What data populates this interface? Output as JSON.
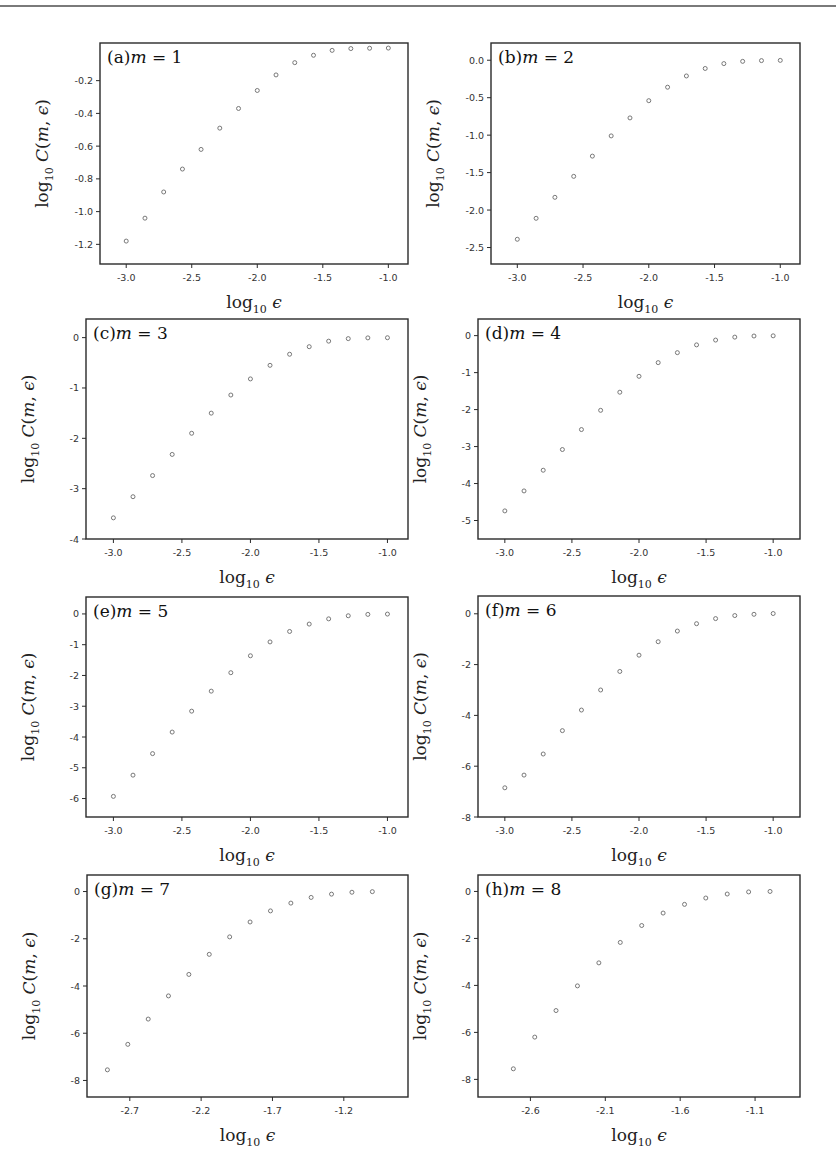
{
  "chart_data": [
    {
      "type": "scatter",
      "panel": "a",
      "title": "(a)m = 1",
      "label_prefix": "(a)",
      "m_value": "1",
      "xlabel": "log10 ε",
      "ylabel": "log10 C(m, ε)",
      "xlim": [
        -3.2,
        -0.85
      ],
      "ylim": [
        -1.32,
        0.03
      ],
      "xticks": [
        -3.0,
        -2.5,
        -2.0,
        -1.5,
        -1.0
      ],
      "xtick_labels": [
        "-3.0",
        "-2.5",
        "-2.0",
        "-1.5",
        "-1.0"
      ],
      "yticks": [
        -1.2,
        -1.0,
        -0.8,
        -0.6,
        -0.4,
        -0.2
      ],
      "ytick_labels": [
        "-1.2",
        "-1.0",
        "-0.8",
        "-0.6",
        "-0.4",
        "-0.2"
      ],
      "x": [
        -3.0,
        -2.857,
        -2.714,
        -2.571,
        -2.429,
        -2.286,
        -2.143,
        -2.0,
        -1.857,
        -1.714,
        -1.571,
        -1.429,
        -1.286,
        -1.143,
        -1.0
      ],
      "y": [
        -1.18,
        -1.04,
        -0.88,
        -0.74,
        -0.62,
        -0.49,
        -0.37,
        -0.26,
        -0.165,
        -0.09,
        -0.045,
        -0.015,
        -0.004,
        -0.002,
        -0.001
      ]
    },
    {
      "type": "scatter",
      "panel": "b",
      "title": "(b)m = 2",
      "label_prefix": "(b)",
      "m_value": "2",
      "xlabel": "log10 ε",
      "ylabel": "log10 C(m, ε)",
      "xlim": [
        -3.2,
        -0.85
      ],
      "ylim": [
        -2.72,
        0.23
      ],
      "xticks": [
        -3.0,
        -2.5,
        -2.0,
        -1.5,
        -1.0
      ],
      "xtick_labels": [
        "-3.0",
        "-2.5",
        "-2.0",
        "-1.5",
        "-1.0"
      ],
      "yticks": [
        -2.5,
        -2.0,
        -1.5,
        -1.0,
        -0.5,
        0.0
      ],
      "ytick_labels": [
        "-2.5",
        "-2.0",
        "-1.5",
        "-1.0",
        "-0.5",
        "0.0"
      ],
      "x": [
        -3.0,
        -2.857,
        -2.714,
        -2.571,
        -2.429,
        -2.286,
        -2.143,
        -2.0,
        -1.857,
        -1.714,
        -1.571,
        -1.429,
        -1.286,
        -1.143,
        -1.0
      ],
      "y": [
        -2.39,
        -2.11,
        -1.83,
        -1.55,
        -1.28,
        -1.01,
        -0.77,
        -0.54,
        -0.36,
        -0.21,
        -0.11,
        -0.045,
        -0.015,
        -0.005,
        -0.002
      ]
    },
    {
      "type": "scatter",
      "panel": "c",
      "title": "(c)m = 3",
      "label_prefix": "(c)",
      "m_value": "3",
      "xlabel": "log10 ε",
      "ylabel": "log10 C(m, ε)",
      "xlim": [
        -3.2,
        -0.85
      ],
      "ylim": [
        -4.0,
        0.37
      ],
      "xticks": [
        -3.0,
        -2.5,
        -2.0,
        -1.5,
        -1.0
      ],
      "xtick_labels": [
        "-3.0",
        "-2.5",
        "-2.0",
        "-1.5",
        "-1.0"
      ],
      "yticks": [
        -4,
        -3,
        -2,
        -1,
        0
      ],
      "ytick_labels": [
        "-4",
        "-3",
        "-2",
        "-1",
        "0"
      ],
      "x": [
        -3.0,
        -2.857,
        -2.714,
        -2.571,
        -2.429,
        -2.286,
        -2.143,
        -2.0,
        -1.857,
        -1.714,
        -1.571,
        -1.429,
        -1.286,
        -1.143,
        -1.0
      ],
      "y": [
        -3.58,
        -3.16,
        -2.74,
        -2.32,
        -1.9,
        -1.5,
        -1.14,
        -0.82,
        -0.55,
        -0.33,
        -0.18,
        -0.07,
        -0.02,
        -0.005,
        -0.002
      ]
    },
    {
      "type": "scatter",
      "panel": "d",
      "title": "(d)m = 4",
      "label_prefix": "(d)",
      "m_value": "4",
      "xlabel": "log10 ε",
      "ylabel": "log10 C(m, ε)",
      "xlim": [
        -3.2,
        -0.8
      ],
      "ylim": [
        -5.5,
        0.45
      ],
      "xticks": [
        -3.0,
        -2.5,
        -2.0,
        -1.5,
        -1.0
      ],
      "xtick_labels": [
        "-3.0",
        "-2.5",
        "-2.0",
        "-1.5",
        "-1.0"
      ],
      "yticks": [
        -5,
        -4,
        -3,
        -2,
        -1,
        0
      ],
      "ytick_labels": [
        "-5",
        "-4",
        "-3",
        "-2",
        "-1",
        "0"
      ],
      "x": [
        -3.0,
        -2.857,
        -2.714,
        -2.571,
        -2.429,
        -2.286,
        -2.143,
        -2.0,
        -1.857,
        -1.714,
        -1.571,
        -1.429,
        -1.286,
        -1.143,
        -1.0
      ],
      "y": [
        -4.74,
        -4.2,
        -3.64,
        -3.08,
        -2.54,
        -2.02,
        -1.53,
        -1.1,
        -0.73,
        -0.46,
        -0.25,
        -0.12,
        -0.04,
        -0.01,
        -0.005
      ]
    },
    {
      "type": "scatter",
      "panel": "e",
      "title": "(e)m = 5",
      "label_prefix": "(e)",
      "m_value": "5",
      "xlabel": "log10 ε",
      "ylabel": "log10 C(m, ε)",
      "xlim": [
        -3.2,
        -0.85
      ],
      "ylim": [
        -6.6,
        0.55
      ],
      "xticks": [
        -3.0,
        -2.5,
        -2.0,
        -1.5,
        -1.0
      ],
      "xtick_labels": [
        "-3.0",
        "-2.5",
        "-2.0",
        "-1.5",
        "-1.0"
      ],
      "yticks": [
        -6,
        -5,
        -4,
        -3,
        -2,
        -1,
        0
      ],
      "ytick_labels": [
        "-6",
        "-5",
        "-4",
        "-3",
        "-2",
        "-1",
        "0"
      ],
      "x": [
        -3.0,
        -2.857,
        -2.714,
        -2.571,
        -2.429,
        -2.286,
        -2.143,
        -2.0,
        -1.857,
        -1.714,
        -1.571,
        -1.429,
        -1.286,
        -1.143,
        -1.0
      ],
      "y": [
        -5.93,
        -5.24,
        -4.54,
        -3.84,
        -3.16,
        -2.51,
        -1.91,
        -1.36,
        -0.91,
        -0.57,
        -0.33,
        -0.16,
        -0.06,
        -0.015,
        -0.005
      ]
    },
    {
      "type": "scatter",
      "panel": "f",
      "title": "(f)m = 6",
      "label_prefix": "(f)",
      "m_value": "6",
      "xlabel": "log10 ε",
      "ylabel": "log10 C(m, ε)",
      "xlim": [
        -3.2,
        -0.8
      ],
      "ylim": [
        -8.0,
        0.7
      ],
      "xticks": [
        -3.0,
        -2.5,
        -2.0,
        -1.5,
        -1.0
      ],
      "xtick_labels": [
        "-3.0",
        "-2.5",
        "-2.0",
        "-1.5",
        "-1.0"
      ],
      "yticks": [
        -8,
        -6,
        -4,
        -2,
        0
      ],
      "ytick_labels": [
        "-8",
        "-6",
        "-4",
        "-2",
        "0"
      ],
      "x": [
        -3.0,
        -2.857,
        -2.714,
        -2.571,
        -2.429,
        -2.286,
        -2.143,
        -2.0,
        -1.857,
        -1.714,
        -1.571,
        -1.429,
        -1.286,
        -1.143,
        -1.0
      ],
      "y": [
        -6.85,
        -6.35,
        -5.52,
        -4.6,
        -3.79,
        -3.0,
        -2.27,
        -1.63,
        -1.1,
        -0.68,
        -0.39,
        -0.19,
        -0.07,
        -0.02,
        0.01
      ]
    },
    {
      "type": "scatter",
      "panel": "g",
      "title": "(g)m = 7",
      "label_prefix": "(g)",
      "m_value": "7",
      "xlabel": "log10 ε",
      "ylabel": "log10 C(m, ε)",
      "xlim": [
        -3.0,
        -0.75
      ],
      "ylim": [
        -8.7,
        0.7
      ],
      "xticks": [
        -2.7,
        -2.2,
        -1.7,
        -1.2
      ],
      "xtick_labels": [
        "-2.7",
        "-2.2",
        "-1.7",
        "-1.2"
      ],
      "yticks": [
        -8,
        -6,
        -4,
        -2,
        0
      ],
      "ytick_labels": [
        "-8",
        "-6",
        "-4",
        "-2",
        "0"
      ],
      "x": [
        -2.857,
        -2.714,
        -2.571,
        -2.429,
        -2.286,
        -2.143,
        -2.0,
        -1.857,
        -1.714,
        -1.571,
        -1.429,
        -1.286,
        -1.143,
        -1.0
      ],
      "y": [
        -7.55,
        -6.47,
        -5.4,
        -4.42,
        -3.51,
        -2.66,
        -1.92,
        -1.29,
        -0.82,
        -0.49,
        -0.25,
        -0.11,
        -0.03,
        -0.005
      ]
    },
    {
      "type": "scatter",
      "panel": "h",
      "title": "(h)m = 8",
      "label_prefix": "(h)",
      "m_value": "8",
      "xlabel": "log10 ε",
      "ylabel": "log10 C(m, ε)",
      "xlim": [
        -2.95,
        -0.8
      ],
      "ylim": [
        -8.75,
        0.7
      ],
      "xticks": [
        -2.6,
        -2.1,
        -1.6,
        -1.1
      ],
      "xtick_labels": [
        "-2.6",
        "-2.1",
        "-1.6",
        "-1.1"
      ],
      "yticks": [
        -8,
        -6,
        -4,
        -2,
        0
      ],
      "ytick_labels": [
        "-8",
        "-6",
        "-4",
        "-2",
        "0"
      ],
      "x": [
        -2.714,
        -2.571,
        -2.429,
        -2.286,
        -2.143,
        -2.0,
        -1.857,
        -1.714,
        -1.571,
        -1.429,
        -1.286,
        -1.143,
        -1.0
      ],
      "y": [
        -7.55,
        -6.2,
        -5.07,
        -4.02,
        -3.04,
        -2.17,
        -1.45,
        -0.92,
        -0.55,
        -0.28,
        -0.11,
        -0.02,
        0.0
      ]
    }
  ],
  "layout_panels": [
    {
      "left": 100,
      "top": 43,
      "width": 308,
      "height": 221
    },
    {
      "left": 491,
      "top": 43,
      "width": 309,
      "height": 221
    },
    {
      "left": 86,
      "top": 319,
      "width": 322,
      "height": 220
    },
    {
      "left": 478,
      "top": 319,
      "width": 322,
      "height": 220
    },
    {
      "left": 86,
      "top": 597,
      "width": 322,
      "height": 220
    },
    {
      "left": 478,
      "top": 596,
      "width": 322,
      "height": 221
    },
    {
      "left": 87,
      "top": 875,
      "width": 321,
      "height": 222
    },
    {
      "left": 478,
      "top": 875,
      "width": 322,
      "height": 222
    }
  ],
  "colors": {
    "marker": "#6a6a6a",
    "frame": "#2a2a2a",
    "text": "#333333"
  }
}
